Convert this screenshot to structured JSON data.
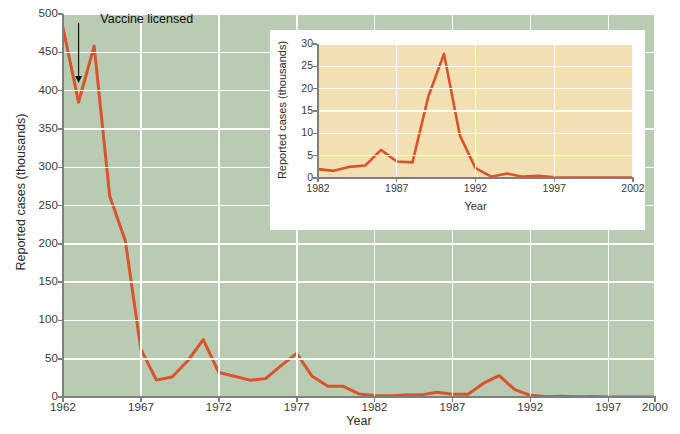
{
  "chart_data": [
    {
      "id": "main",
      "type": "line",
      "title": "",
      "xlabel": "Year",
      "ylabel": "Reported cases (thousands)",
      "xlim": [
        1962,
        2000
      ],
      "ylim": [
        0,
        500
      ],
      "grid": true,
      "legend": "none",
      "line_color": "#d9532c",
      "plot_bg": "#b9cbb2",
      "grid_color": "#fdfdfb",
      "xticks": [
        1962,
        1967,
        1972,
        1977,
        1982,
        1987,
        1992,
        1997,
        2000
      ],
      "xtick_labels": [
        "1962",
        "1967",
        "1972",
        "1977",
        "1982",
        "1987",
        "1992",
        "1997",
        "2000"
      ],
      "yticks": [
        0,
        50,
        100,
        150,
        200,
        250,
        300,
        350,
        400,
        450,
        500
      ],
      "ytick_labels": [
        "0",
        "50",
        "100",
        "150",
        "200",
        "250",
        "300",
        "350",
        "400",
        "450",
        "500"
      ],
      "annotations": [
        {
          "text": "Vaccine licensed",
          "target_x": 1963,
          "target_y": 410,
          "label_x": 1964.2,
          "label_y": 492,
          "arrow": "down"
        }
      ],
      "x": [
        1962,
        1963,
        1964,
        1965,
        1966,
        1967,
        1968,
        1969,
        1970,
        1971,
        1972,
        1973,
        1974,
        1975,
        1976,
        1977,
        1978,
        1979,
        1980,
        1981,
        1982,
        1983,
        1984,
        1985,
        1986,
        1987,
        1988,
        1989,
        1990,
        1991,
        1992,
        1993,
        1994,
        1995,
        1996,
        1997,
        1998,
        1999,
        2000
      ],
      "values": [
        482,
        385,
        458,
        262,
        204,
        62,
        22,
        26,
        47,
        75,
        32,
        27,
        22,
        24,
        41,
        57,
        27,
        14,
        14,
        4,
        2,
        1.5,
        2.6,
        2.8,
        6.3,
        3.7,
        3.5,
        18,
        27.8,
        9.6,
        2.2,
        0.3,
        1,
        0.3,
        0.5,
        0.1,
        0.1,
        0.1,
        0.1
      ]
    },
    {
      "id": "inset",
      "type": "line",
      "title": "",
      "xlabel": "Year",
      "ylabel": "Reported cases (thousands)",
      "xlim": [
        1982,
        2002
      ],
      "ylim": [
        0,
        30
      ],
      "grid": true,
      "legend": "none",
      "line_color": "#d9532c",
      "plot_bg": "#f2dfb3",
      "grid_color": "#fdfdfb",
      "panel_bg": "#ffffff",
      "xticks": [
        1982,
        1987,
        1992,
        1997,
        2002
      ],
      "xtick_labels": [
        "1982",
        "1987",
        "1992",
        "1997",
        "2002"
      ],
      "yticks": [
        0,
        5,
        10,
        15,
        20,
        25,
        30
      ],
      "ytick_labels": [
        "0",
        "5",
        "10",
        "15",
        "20",
        "25",
        "30"
      ],
      "x": [
        1982,
        1983,
        1984,
        1985,
        1986,
        1987,
        1988,
        1989,
        1990,
        1991,
        1992,
        1993,
        1994,
        1995,
        1996,
        1997,
        1998,
        1999,
        2000,
        2001,
        2002
      ],
      "values": [
        2.0,
        1.6,
        2.5,
        2.8,
        6.3,
        3.7,
        3.5,
        18.2,
        27.8,
        9.6,
        2.2,
        0.3,
        1.0,
        0.3,
        0.5,
        0.14,
        0.1,
        0.1,
        0.09,
        0.1,
        0.1
      ]
    }
  ],
  "main": {
    "ylabel": "Reported cases (thousands)",
    "xlabel": "Year",
    "annotation_label": "Vaccine licensed"
  },
  "inset": {
    "ylabel": "Reported cases (thousands)",
    "xlabel": "Year"
  }
}
